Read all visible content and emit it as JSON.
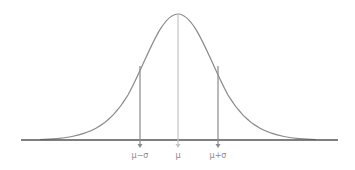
{
  "diagram": {
    "colors": {
      "curve": "#8a8a8a",
      "axis": "#555555",
      "mean_line": "#c4c4c4",
      "sigma_line": "#8a8a8a",
      "label": "#888888"
    },
    "markers": [
      {
        "id": "mu-minus-sigma",
        "label": "μ−σ",
        "x": 140
      },
      {
        "id": "mu",
        "label": "μ",
        "x": 178
      },
      {
        "id": "mu-plus-sigma",
        "label": "μ+σ",
        "x": 218
      }
    ]
  }
}
